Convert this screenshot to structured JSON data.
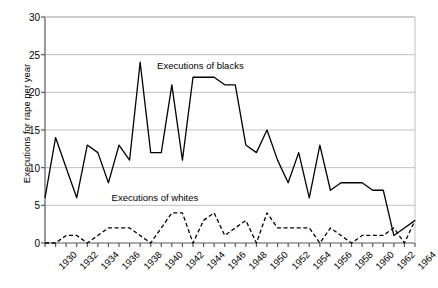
{
  "chart_data": {
    "type": "line",
    "title": "",
    "xlabel": "",
    "ylabel": "Executions for rape per year",
    "xlim": [
      1930,
      1965
    ],
    "ylim": [
      0,
      30
    ],
    "ytick_values": [
      0,
      5,
      10,
      15,
      20,
      25,
      30
    ],
    "ytick_labels": [
      "0",
      "5",
      "10",
      "15",
      "20",
      "25",
      "30"
    ],
    "xtick_labels": [
      "1930",
      "1932",
      "1934",
      "1936",
      "1938",
      "1940",
      "1942",
      "1944",
      "1946",
      "1948",
      "1950",
      "1952",
      "1954",
      "1956",
      "1958",
      "1960",
      "1962",
      "1964"
    ],
    "xtick_values": [
      1930,
      1932,
      1934,
      1936,
      1938,
      1940,
      1942,
      1944,
      1946,
      1948,
      1950,
      1952,
      1954,
      1956,
      1958,
      1960,
      1962,
      1964
    ],
    "minor_xticks_every": 1,
    "grid": "horizontal",
    "legend_position": "inline-annotation",
    "x": [
      1930,
      1931,
      1932,
      1933,
      1934,
      1935,
      1936,
      1937,
      1938,
      1939,
      1940,
      1941,
      1942,
      1943,
      1944,
      1945,
      1946,
      1947,
      1948,
      1949,
      1950,
      1951,
      1952,
      1953,
      1954,
      1955,
      1956,
      1957,
      1958,
      1959,
      1960,
      1961,
      1962,
      1963,
      1964,
      1965
    ],
    "series": [
      {
        "name": "Executions of blacks",
        "style": "solid",
        "color": "#000000",
        "values": [
          6,
          14,
          10,
          6,
          13,
          12,
          8,
          13,
          11,
          24,
          12,
          12,
          21,
          11,
          22,
          22,
          22,
          21,
          21,
          13,
          12,
          15,
          11,
          8,
          12,
          6,
          13,
          7,
          8,
          8,
          8,
          7,
          7,
          1,
          2,
          3
        ]
      },
      {
        "name": "Executions of whites",
        "style": "dashed",
        "color": "#000000",
        "values": [
          0,
          0,
          1,
          1,
          0,
          1,
          2,
          2,
          2,
          1,
          0,
          2,
          4,
          4,
          0,
          3,
          4,
          1,
          2,
          3,
          0,
          4,
          2,
          2,
          2,
          2,
          0,
          2,
          1,
          0,
          1,
          1,
          1,
          2,
          0,
          3
        ]
      }
    ],
    "annotations": [
      {
        "text": "Executions of blacks",
        "x": 1940.6,
        "y": 23.4
      },
      {
        "text": "Executions of whites",
        "x": 1936.3,
        "y": 5.8
      }
    ]
  }
}
